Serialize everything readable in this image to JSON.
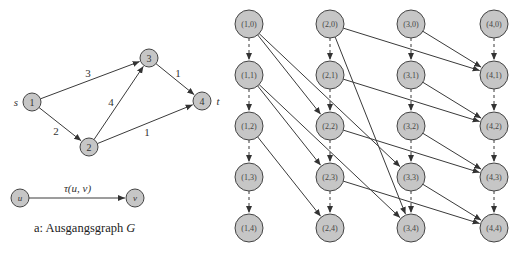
{
  "left_graph": {
    "nodes": [
      {
        "id": "1",
        "label": "1",
        "x": 32,
        "y": 102,
        "side_label": "s",
        "side": "left"
      },
      {
        "id": "2",
        "label": "2",
        "x": 89,
        "y": 147
      },
      {
        "id": "3",
        "label": "3",
        "x": 149,
        "y": 58
      },
      {
        "id": "4",
        "label": "4",
        "x": 202,
        "y": 101,
        "side_label": "t",
        "side": "right"
      }
    ],
    "edges": [
      {
        "from": "1",
        "to": "3",
        "weight": "3",
        "lx": 88,
        "ly": 73
      },
      {
        "from": "1",
        "to": "2",
        "weight": "2",
        "lx": 56,
        "ly": 131
      },
      {
        "from": "2",
        "to": "3",
        "weight": "4",
        "lx": 111,
        "ly": 102
      },
      {
        "from": "3",
        "to": "4",
        "weight": "1",
        "lx": 178,
        "ly": 73
      },
      {
        "from": "2",
        "to": "4",
        "weight": "1",
        "lx": 147,
        "ly": 132
      }
    ]
  },
  "legend": {
    "u_label": "u",
    "v_label": "v",
    "edge_label": "τ(u, v)",
    "u": {
      "x": 20,
      "y": 198
    },
    "v": {
      "x": 135,
      "y": 198
    }
  },
  "caption": {
    "prefix": "a: Ausgangsgraph ",
    "symbol": "G"
  },
  "right_graph": {
    "columns": [
      249,
      330,
      411,
      494
    ],
    "rows": [
      24,
      75,
      126,
      177,
      228
    ],
    "nodes": [
      "(1,0)",
      "(1,1)",
      "(1,2)",
      "(1,3)",
      "(1,4)",
      "(2,0)",
      "(2,1)",
      "(2,2)",
      "(2,3)",
      "(2,4)",
      "(3,0)",
      "(3,1)",
      "(3,2)",
      "(3,3)",
      "(3,4)",
      "(4,0)",
      "(4,1)",
      "(4,2)",
      "(4,3)",
      "(4,4)"
    ],
    "wait_edges": "dashed vertical edges (i,t)->(i,t+1) for each column",
    "travel_edges": [
      {
        "from": [
          1,
          0
        ],
        "to": [
          2,
          2
        ]
      },
      {
        "from": [
          1,
          0
        ],
        "to": [
          3,
          3
        ]
      },
      {
        "from": [
          1,
          1
        ],
        "to": [
          2,
          3
        ]
      },
      {
        "from": [
          1,
          1
        ],
        "to": [
          3,
          4
        ]
      },
      {
        "from": [
          1,
          2
        ],
        "to": [
          2,
          4
        ]
      },
      {
        "from": [
          2,
          0
        ],
        "to": [
          3,
          4
        ]
      },
      {
        "from": [
          2,
          0
        ],
        "to": [
          4,
          1
        ]
      },
      {
        "from": [
          2,
          1
        ],
        "to": [
          4,
          2
        ]
      },
      {
        "from": [
          2,
          2
        ],
        "to": [
          4,
          3
        ]
      },
      {
        "from": [
          2,
          3
        ],
        "to": [
          4,
          4
        ]
      },
      {
        "from": [
          3,
          0
        ],
        "to": [
          4,
          1
        ]
      },
      {
        "from": [
          3,
          1
        ],
        "to": [
          4,
          2
        ]
      },
      {
        "from": [
          3,
          2
        ],
        "to": [
          4,
          3
        ]
      },
      {
        "from": [
          3,
          3
        ],
        "to": [
          4,
          4
        ]
      }
    ]
  }
}
